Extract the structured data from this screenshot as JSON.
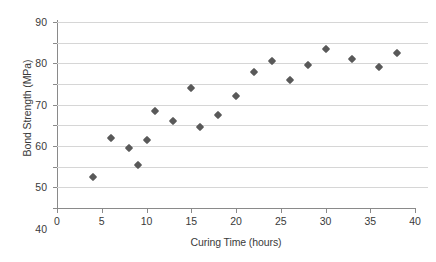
{
  "chart_data": {
    "type": "scatter",
    "title": "",
    "xlabel": "Curing Time (hours)",
    "ylabel": "Bond Strength (MPa)",
    "xlim": [
      0,
      40
    ],
    "ylim": [
      0,
      90
    ],
    "xticks": [
      0,
      5,
      10,
      15,
      20,
      25,
      30,
      35,
      40
    ],
    "yticks": [
      0,
      10,
      20,
      30,
      40,
      50,
      60,
      70,
      80,
      90
    ],
    "grid": "horizontal",
    "legend": "none",
    "marker": "diamond",
    "marker_color": "#595959",
    "x": [
      4,
      6,
      8,
      9,
      10,
      11,
      13,
      15,
      16,
      18,
      20,
      22,
      24,
      26,
      28,
      30,
      33,
      36,
      38
    ],
    "y": [
      15,
      34,
      29,
      21,
      33,
      47,
      42,
      58,
      39,
      45,
      54,
      66,
      71,
      62,
      69,
      77,
      72,
      68,
      75
    ],
    "points": [
      {
        "x": 4,
        "y": 15
      },
      {
        "x": 6,
        "y": 34
      },
      {
        "x": 8,
        "y": 29
      },
      {
        "x": 9,
        "y": 21
      },
      {
        "x": 10,
        "y": 33
      },
      {
        "x": 11,
        "y": 47
      },
      {
        "x": 13,
        "y": 42
      },
      {
        "x": 15,
        "y": 58
      },
      {
        "x": 16,
        "y": 39
      },
      {
        "x": 18,
        "y": 45
      },
      {
        "x": 20,
        "y": 54
      },
      {
        "x": 22,
        "y": 66
      },
      {
        "x": 24,
        "y": 71
      },
      {
        "x": 26,
        "y": 62
      },
      {
        "x": 28,
        "y": 69
      },
      {
        "x": 30,
        "y": 77
      },
      {
        "x": 33,
        "y": 72
      },
      {
        "x": 36,
        "y": 68
      },
      {
        "x": 38,
        "y": 75
      }
    ]
  },
  "colors": {
    "marker": "#595959",
    "gridline": "#d6d6d6",
    "axis": "#8a8a8a",
    "text": "#3a3a3a",
    "background": "#ffffff"
  }
}
